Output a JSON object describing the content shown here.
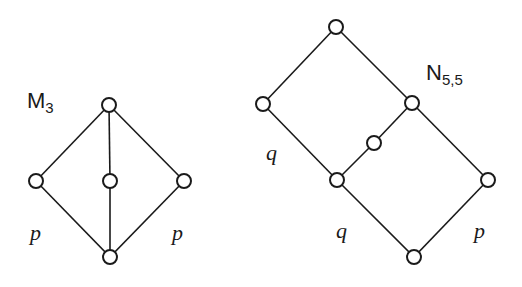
{
  "diagrams": [
    {
      "name": "M3",
      "title_main": "M",
      "title_sub": "3",
      "nodes": [
        {
          "id": "top",
          "x": 109,
          "y": 105
        },
        {
          "id": "left",
          "x": 36,
          "y": 181
        },
        {
          "id": "middle",
          "x": 110,
          "y": 181
        },
        {
          "id": "right",
          "x": 184,
          "y": 181
        },
        {
          "id": "bottom",
          "x": 110,
          "y": 257
        }
      ],
      "edges": [
        [
          "top",
          "left"
        ],
        [
          "top",
          "middle"
        ],
        [
          "top",
          "right"
        ],
        [
          "left",
          "bottom"
        ],
        [
          "middle",
          "bottom"
        ],
        [
          "right",
          "bottom"
        ]
      ],
      "labels": [
        {
          "text": "p",
          "x": 30,
          "y": 240
        },
        {
          "text": "p",
          "x": 172,
          "y": 240
        }
      ]
    },
    {
      "name": "N5,5",
      "title_main": "N",
      "title_sub": "5,5",
      "nodes": [
        {
          "id": "top",
          "x": 336,
          "y": 27
        },
        {
          "id": "left",
          "x": 263,
          "y": 104
        },
        {
          "id": "upper-right",
          "x": 412,
          "y": 103
        },
        {
          "id": "mid",
          "x": 374,
          "y": 143
        },
        {
          "id": "center",
          "x": 337,
          "y": 180
        },
        {
          "id": "far-right",
          "x": 488,
          "y": 180
        },
        {
          "id": "bottom",
          "x": 414,
          "y": 257
        }
      ],
      "edges": [
        [
          "top",
          "left"
        ],
        [
          "top",
          "upper-right"
        ],
        [
          "left",
          "center"
        ],
        [
          "upper-right",
          "mid"
        ],
        [
          "mid",
          "center"
        ],
        [
          "upper-right",
          "far-right"
        ],
        [
          "center",
          "bottom"
        ],
        [
          "far-right",
          "bottom"
        ]
      ],
      "labels": [
        {
          "text": "q",
          "x": 266,
          "y": 160
        },
        {
          "text": "q",
          "x": 336,
          "y": 238
        },
        {
          "text": "p",
          "x": 474,
          "y": 238
        }
      ]
    }
  ]
}
